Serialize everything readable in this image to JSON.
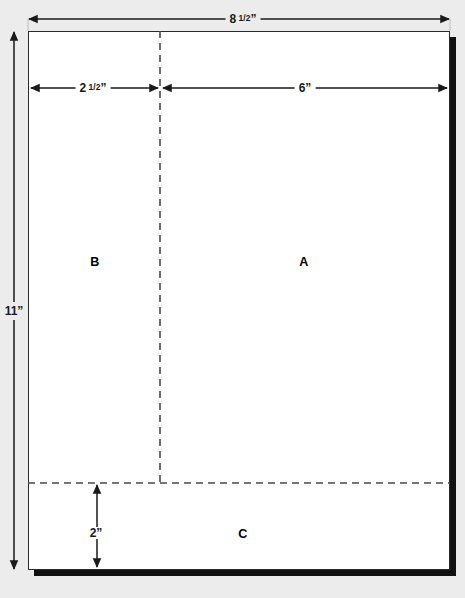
{
  "diagram": {
    "background_color": "#ececec",
    "sheet_color": "#ffffff",
    "line_color": "#1a1a1a",
    "shadow_color": "#111111"
  },
  "zones": [
    {
      "id": "a",
      "label": "A",
      "name": "zone-a"
    },
    {
      "id": "b",
      "label": "B",
      "name": "zone-b"
    },
    {
      "id": "c",
      "label": "C",
      "name": "zone-c"
    }
  ],
  "dimensions": {
    "width_top": {
      "whole": "8",
      "numerator": "1",
      "denominator": "2",
      "unit": "”",
      "text": "8 1/2”"
    },
    "height_left": {
      "whole": "11",
      "numerator": "",
      "denominator": "",
      "unit": "”",
      "text": "11”"
    },
    "column_b": {
      "whole": "2",
      "numerator": "1",
      "denominator": "2",
      "unit": "”",
      "text": "2 1/2”"
    },
    "column_a": {
      "whole": "6",
      "numerator": "",
      "denominator": "",
      "unit": "”",
      "text": "6”"
    },
    "bottom_band": {
      "whole": "2",
      "numerator": "",
      "denominator": "",
      "unit": "”",
      "text": "2”"
    }
  },
  "guides": {
    "vertical_dashed_label": "column-divider",
    "horizontal_dashed_label": "bottom-band-divider"
  }
}
